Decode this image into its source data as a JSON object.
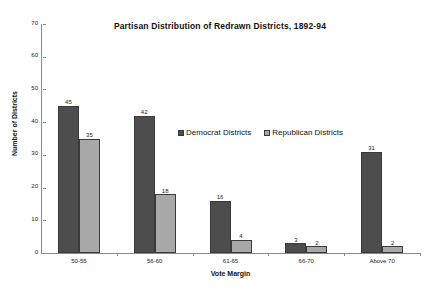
{
  "chart_data": {
    "type": "bar",
    "title": "Partisan Distribution of Redrawn Districts, 1892-94",
    "xlabel": "Vote Margin",
    "ylabel": "Number of Districts",
    "categories": [
      "50-55",
      "56-60",
      "61-65",
      "66-70",
      "Above 70"
    ],
    "series": [
      {
        "name": "Democrat Districts",
        "color": "#4d4d4d",
        "values": [
          45,
          42,
          16,
          3,
          31
        ]
      },
      {
        "name": "Republican Districts",
        "color": "#a8a8a8",
        "values": [
          35,
          18,
          4,
          2,
          2
        ]
      }
    ],
    "ylim": [
      0,
      70
    ],
    "yticks": [
      0,
      10,
      20,
      30,
      40,
      50,
      60,
      70
    ],
    "grid": false,
    "legend_position": "center",
    "data_labels": true
  }
}
